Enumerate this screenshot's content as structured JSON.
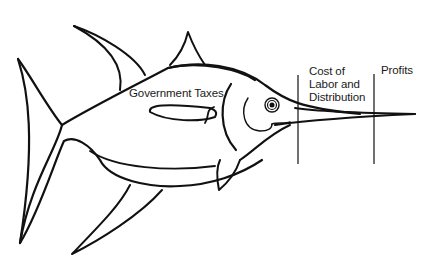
{
  "diagram": {
    "type": "illustrated-breakdown",
    "colors": {
      "line": "#111111",
      "background": "#ffffff",
      "text": "#1a1a1a"
    },
    "labels": {
      "government_taxes": "Government Taxes",
      "cost_line1": "Cost of",
      "cost_line2": "Labor and",
      "cost_line3": "Distribution",
      "profits": "Profits"
    },
    "segments": [
      {
        "name": "Government Taxes",
        "region": "body"
      },
      {
        "name": "Cost of Labor and Distribution",
        "region": "between-dividers"
      },
      {
        "name": "Profits",
        "region": "bill-tip"
      }
    ]
  }
}
